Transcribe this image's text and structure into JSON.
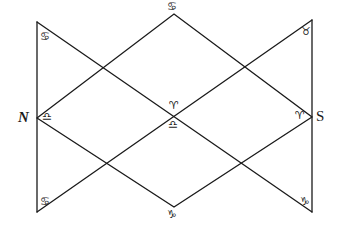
{
  "diagram": {
    "type": "astrological-square-chart",
    "stroke_color": "#1a1a1a",
    "background": "#ffffff",
    "cardinal_labels": {
      "north": "N",
      "south": "S"
    },
    "symbols": {
      "top_left_corner": "♋",
      "top_apex": "♋",
      "top_right_corner": "♉",
      "north_point": "♎",
      "center_upper": "♈",
      "center_lower": "♎",
      "south_point": "♈",
      "bottom_left_corner": "♋",
      "bottom_apex": "♑",
      "bottom_right_corner": "♑"
    },
    "symbol_names": {
      "top_left_corner": "cancer",
      "top_apex": "cancer",
      "top_right_corner": "taurus",
      "north_point": "libra",
      "center_upper": "aries",
      "center_lower": "libra",
      "south_point": "aries",
      "bottom_left_corner": "cancer",
      "bottom_apex": "capricorn",
      "bottom_right_corner": "capricorn"
    }
  }
}
